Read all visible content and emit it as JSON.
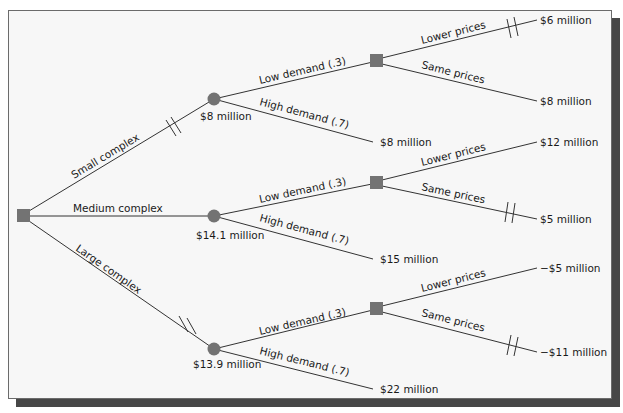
{
  "colors": {
    "node_fill": "#737373",
    "line": "#333333",
    "background": "#f7f7f7",
    "shadow": "#474747"
  },
  "diagram": {
    "type": "decision-tree",
    "root": {
      "shape": "square",
      "type": "decision"
    },
    "branches": [
      {
        "label": "Small complex",
        "pruned": true,
        "chance_value": "$8 million",
        "outcomes": [
          {
            "label": "Low demand (.3)",
            "decision": {
              "options": [
                {
                  "label": "Lower prices",
                  "value": "$6 million",
                  "pruned": true
                },
                {
                  "label": "Same prices",
                  "value": "$8 million",
                  "pruned": false
                }
              ]
            }
          },
          {
            "label": "High demand (.7)",
            "value": "$8 million"
          }
        ]
      },
      {
        "label": "Medium complex",
        "pruned": false,
        "chance_value": "$14.1 million",
        "outcomes": [
          {
            "label": "Low demand (.3)",
            "decision": {
              "options": [
                {
                  "label": "Lower prices",
                  "value": "$12 million",
                  "pruned": false
                },
                {
                  "label": "Same prices",
                  "value": "$5 million",
                  "pruned": true
                }
              ]
            }
          },
          {
            "label": "High demand (.7)",
            "value": "$15 million"
          }
        ]
      },
      {
        "label": "Large complex",
        "pruned": true,
        "chance_value": "$13.9 million",
        "outcomes": [
          {
            "label": "Low demand (.3)",
            "decision": {
              "options": [
                {
                  "label": "Lower prices",
                  "value": "−$5 million",
                  "pruned": false
                },
                {
                  "label": "Same prices",
                  "value": "−$11 million",
                  "pruned": true
                }
              ]
            }
          },
          {
            "label": "High demand (.7)",
            "value": "$22 million"
          }
        ]
      }
    ]
  }
}
